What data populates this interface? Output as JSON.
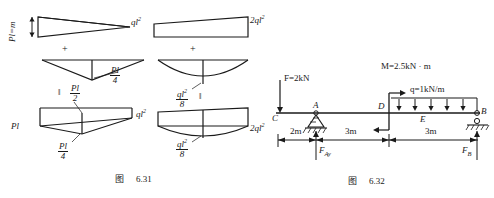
{
  "figure_631": {
    "caption_prefix": "图",
    "caption_number": "6.31",
    "left_column": {
      "top_diagram": {
        "label_vertical": "Pl=m",
        "shape": "triangle-taper-right"
      },
      "operator_plus": "+",
      "middle_diagram": {
        "label_moment": "Pl",
        "label_denominator": "4",
        "shape": "triangle-downward"
      },
      "operator_equals": "‖",
      "bottom_diagram": {
        "label_left": "Pl",
        "label_top_num": "Pl",
        "label_top_den": "2",
        "label_bottom_num": "Pl",
        "label_bottom_den": "4"
      }
    },
    "right_column": {
      "top_diagram": {
        "label_left": "ql",
        "label_left_exp": "2",
        "label_right": "2ql",
        "label_right_exp": "2",
        "shape": "trapezoid"
      },
      "operator_plus": "+",
      "middle_diagram": {
        "label_num": "ql",
        "label_num_exp": "2",
        "label_den": "8",
        "shape": "parabola-sag"
      },
      "operator_equals": "‖",
      "bottom_diagram": {
        "label_left": "ql",
        "label_left_exp": "2",
        "label_right": "2ql",
        "label_right_exp": "2",
        "label_num": "ql",
        "label_num_exp": "2",
        "label_den": "8"
      }
    }
  },
  "figure_632": {
    "caption_prefix": "图",
    "caption_number": "6.32",
    "loads": {
      "point_force": "F=2kN",
      "moment": "M=2.5kN · m",
      "distributed": "q=1kN/m"
    },
    "points": {
      "c": "C",
      "a": "A",
      "d": "D",
      "e": "E",
      "b": "B"
    },
    "reactions": {
      "a_vertical": "F",
      "a_vertical_sub": "Ay",
      "b_vertical": "F",
      "b_vertical_sub": "B"
    },
    "dimensions": [
      "2m",
      "3m",
      "3m"
    ]
  },
  "colors": {
    "line": "#1a1a1a",
    "background": "#ffffff"
  }
}
